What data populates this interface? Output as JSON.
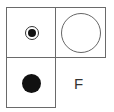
{
  "diagram": {
    "cells": [
      {
        "position": "top-left",
        "content": "dot-in-circle"
      },
      {
        "position": "top-right",
        "content": "large-hollow-circle"
      },
      {
        "position": "bottom-left",
        "content": "filled-dot"
      },
      {
        "position": "bottom-right",
        "content": "label"
      }
    ],
    "label": "F",
    "colors": {
      "line": "#6a6a6a",
      "fill": "#111111",
      "background": "#ffffff"
    }
  }
}
